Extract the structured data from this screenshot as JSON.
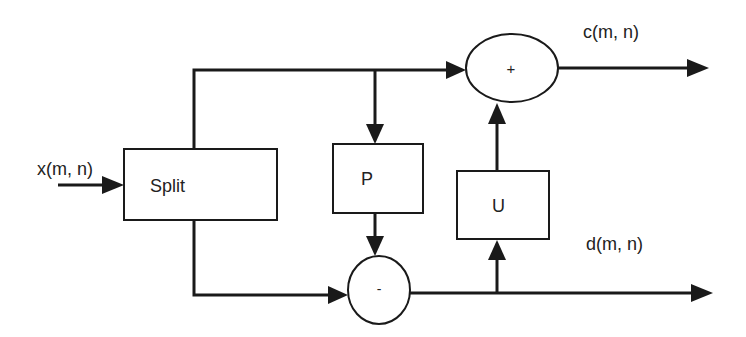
{
  "diagram": {
    "type": "lifting-scheme-block-diagram",
    "colors": {
      "stroke": "#1a1a1a",
      "background": "#ffffff",
      "text": "#222222"
    },
    "input": {
      "label": "x(m, n)"
    },
    "outputs": {
      "coarse": {
        "label": "c(m, n)"
      },
      "detail": {
        "label": "d(m, n)"
      }
    },
    "blocks": {
      "split": {
        "label": "Split"
      },
      "predict": {
        "label": "P"
      },
      "update": {
        "label": "U"
      }
    },
    "junctions": {
      "adder": {
        "symbol": "+"
      },
      "subtractor": {
        "symbol": "-"
      }
    }
  }
}
